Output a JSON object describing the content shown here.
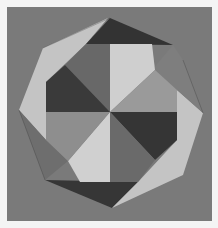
{
  "image": {
    "subject": "geometric folded-paper octagon with pinwheel pattern",
    "caption": "",
    "colors": {
      "page": "#f4f4f4",
      "background": "#7a7a7a",
      "dark": "#383838",
      "mid_dark": "#5e5e5e",
      "mid": "#8e8e8e",
      "light": "#c4c4c4",
      "lighter": "#d2d2d2"
    }
  }
}
